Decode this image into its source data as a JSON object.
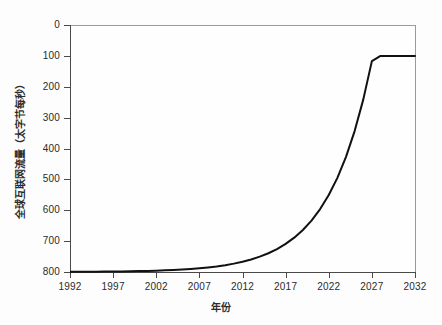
{
  "chart_data": {
    "type": "line",
    "title": "",
    "xlabel": "年份",
    "ylabel": "全球互联网流量（太字节每秒）",
    "xlim": [
      1992,
      2032
    ],
    "ylim": [
      0,
      800
    ],
    "grid": false,
    "legend": null,
    "xticks": [
      "1992",
      "1997",
      "2002",
      "2007",
      "2012",
      "2017",
      "2022",
      "2027",
      "2032"
    ],
    "yticks": [
      "0",
      "100",
      "200",
      "300",
      "400",
      "500",
      "600",
      "700",
      "800"
    ],
    "line_color": "#111111",
    "line_width": 2,
    "series": [
      {
        "name": "全球互联网流量",
        "x": [
          1992,
          1993,
          1994,
          1995,
          1996,
          1997,
          1998,
          1999,
          2000,
          2001,
          2002,
          2003,
          2004,
          2005,
          2006,
          2007,
          2008,
          2009,
          2010,
          2011,
          2012,
          2013,
          2014,
          2015,
          2016,
          2017,
          2018,
          2019,
          2020,
          2021,
          2022,
          2023,
          2024,
          2025,
          2026,
          2027,
          2028,
          2029,
          2030,
          2031,
          2032
        ],
        "values": [
          0.6,
          0.7,
          0.9,
          1.1,
          1.3,
          1.6,
          2.0,
          2.4,
          2.9,
          3.6,
          4.4,
          5.4,
          6.6,
          8.1,
          9.9,
          12.1,
          14.8,
          18.1,
          22.2,
          27.1,
          33.2,
          40.6,
          49.7,
          60.8,
          74.4,
          91.0,
          111.3,
          136.2,
          166.6,
          203.8,
          249.4,
          305.0,
          373.1,
          456.4,
          558.3,
          683.0,
          700.0,
          700.0,
          700.0,
          700.0,
          700.0
        ]
      }
    ],
    "annotations": []
  },
  "axis": {
    "y_tick_values": [
      800,
      700,
      600,
      500,
      400,
      300,
      200,
      100,
      0
    ],
    "x_tick_values": [
      1992,
      1997,
      2002,
      2007,
      2012,
      2017,
      2022,
      2027,
      2032
    ]
  }
}
